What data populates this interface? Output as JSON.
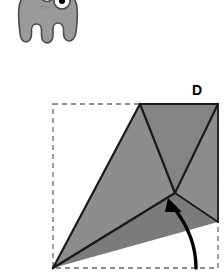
{
  "page": {
    "background_color": "#ffffff",
    "width": 224,
    "height": 279
  },
  "creature": {
    "name": "three-eyed-monster",
    "description": "gray blob monster with three eyes and tentacle legs, cropped at top of frame",
    "body_color": "#9a9a9a",
    "outline_color": "#4a4a4a",
    "eye_fill_color": "#ffffff",
    "pupil_color": "#000000",
    "eye_count": 3,
    "tentacle_count": 5
  },
  "origami": {
    "step_label": "D",
    "paper_outline_color": "#6b6b6b",
    "paper_outline_style": "dashed",
    "fold_line_color": "#1a1a1a",
    "arrow_color": "#000000",
    "arrow_direction": "up-left",
    "shade_light": "#8d8d8d",
    "shade_mid": "#848484",
    "shade_dark": "#7b7b7b",
    "square": {
      "left": 53,
      "top": 104,
      "right": 218,
      "bottom": 268
    }
  }
}
